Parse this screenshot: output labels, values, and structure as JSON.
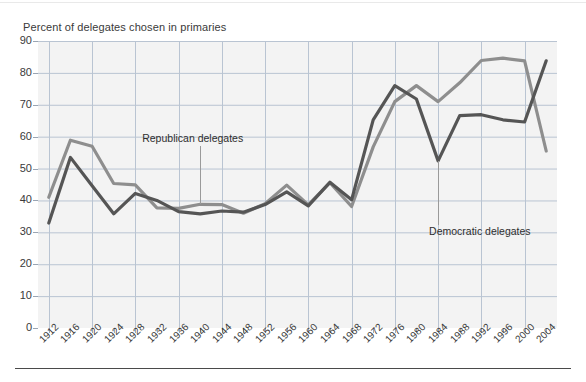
{
  "chart_data": {
    "type": "line",
    "title": "Percent of delegates chosen in primaries",
    "xlabel": "",
    "ylabel": "",
    "ylim": [
      0,
      90
    ],
    "ytick_step": 10,
    "grid": true,
    "legend_position": "inline-annotations",
    "categories": [
      "1912",
      "1916",
      "1920",
      "1924",
      "1928",
      "1932",
      "1936",
      "1940",
      "1944",
      "1948",
      "1952",
      "1956",
      "1960",
      "1964",
      "1968",
      "1972",
      "1976",
      "1980",
      "1984",
      "1988",
      "1992",
      "1996",
      "2000",
      "2004"
    ],
    "yticks": [
      0,
      10,
      20,
      30,
      40,
      50,
      60,
      70,
      80,
      90
    ],
    "series": [
      {
        "name": "Republican delegates",
        "color": "#8e8e8e",
        "values": [
          41.0,
          58.9,
          57.0,
          45.3,
          44.9,
          37.7,
          37.5,
          38.8,
          38.7,
          36.0,
          39.0,
          44.8,
          38.6,
          45.6,
          38.1,
          56.8,
          71.0,
          76.0,
          71.0,
          76.9,
          83.9,
          84.6,
          83.8,
          55.5
        ]
      },
      {
        "name": "Democratic delegates",
        "color": "#555555",
        "values": [
          32.9,
          53.5,
          44.6,
          35.8,
          42.2,
          40.0,
          36.5,
          35.8,
          36.7,
          36.3,
          38.7,
          42.7,
          38.3,
          45.7,
          40.2,
          65.3,
          76.0,
          71.8,
          52.4,
          66.6,
          66.9,
          65.3,
          64.6,
          83.8
        ]
      }
    ],
    "annotations": [
      {
        "text": "Republican delegates",
        "points_to": "1940"
      },
      {
        "text": "Democratic delegates",
        "points_to": "1984"
      }
    ],
    "colors": {
      "plot_background": "#f3f3f3",
      "gridline": "#b9c4d2",
      "axis_text": "#3a3a3a",
      "page_background": "#ffffff"
    }
  }
}
